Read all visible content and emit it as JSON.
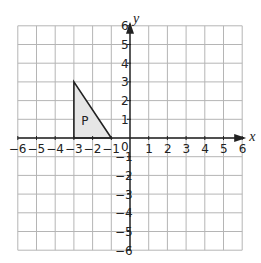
{
  "diagram": {
    "type": "coordinate-grid",
    "x_axis": {
      "label": "x",
      "min": -6,
      "max": 6,
      "ticks": [
        "-6",
        "-5",
        "-4",
        "-3",
        "-2",
        "-1",
        "0",
        "1",
        "2",
        "3",
        "4",
        "5",
        "6"
      ]
    },
    "y_axis": {
      "label": "y",
      "min": -6,
      "max": 6,
      "ticks": [
        "6",
        "5",
        "4",
        "3",
        "2",
        "1",
        "-1",
        "-2",
        "-3",
        "-4",
        "-5",
        "-6"
      ]
    },
    "origin_label": "0",
    "shape": {
      "label": "P",
      "vertices": [
        [
          -3,
          0
        ],
        [
          -3,
          3
        ],
        [
          -1,
          0
        ]
      ],
      "fill": "#e6e6e6",
      "stroke": "#222222"
    },
    "colors": {
      "grid": "#b5b5b5",
      "axis": "#222222"
    }
  }
}
